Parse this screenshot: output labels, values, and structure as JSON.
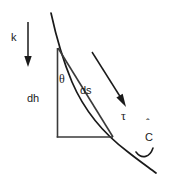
{
  "figure": {
    "background_color": "#ffffff",
    "ink_color": "#1a1a1a",
    "line_color": "#3a3a3a",
    "width": 170,
    "height": 177
  },
  "labels": {
    "k": "k",
    "theta": "θ",
    "dh": "dh",
    "ds": "ds",
    "tau": "τ",
    "c_hat": "C",
    "c_hat_accent": "ˆ"
  },
  "elements": {
    "gravity_vector": {
      "name": "k",
      "direction": "down",
      "x": 28,
      "y_start": 22,
      "y_end": 66
    },
    "tangent_vector": {
      "name": "τ",
      "direction": "down-right",
      "x_start": 92,
      "y_start": 52,
      "x_end": 125,
      "y_end": 105
    },
    "vertical_leg": {
      "name": "dh",
      "x": 57,
      "y_start": 48,
      "y_end": 137
    },
    "horizontal_leg": {
      "x_start": 57,
      "x_end": 113,
      "y": 137
    },
    "curve": {
      "name": "C",
      "x_start": 51,
      "y_start": 13,
      "x_end": 156,
      "y_end": 173
    },
    "angle_marker": {
      "name": "θ",
      "vertex_x": 57,
      "vertex_y": 48
    }
  },
  "label_positions": {
    "k": {
      "x": 15,
      "y": 40
    },
    "theta": {
      "x": 60,
      "y": 82
    },
    "dh": {
      "x": 33,
      "y": 98
    },
    "ds": {
      "x": 82,
      "y": 93
    },
    "tau": {
      "x": 124,
      "y": 118
    },
    "c_hat": {
      "x": 149,
      "y": 141
    }
  }
}
